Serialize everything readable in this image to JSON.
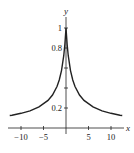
{
  "chart_data": {
    "type": "line",
    "title": "",
    "xlabel": "x",
    "ylabel": "y",
    "xlim": [
      -12.5,
      12.5
    ],
    "ylim": [
      0,
      1.05
    ],
    "grid": false,
    "legend": null,
    "x_ticks": [
      -10,
      -5,
      5,
      10
    ],
    "x_tick_labels": [
      "−10",
      "−5",
      "5",
      "10"
    ],
    "y_ticks": [
      0.2,
      0.4,
      0.6,
      0.8,
      1
    ],
    "y_tick_labels": [
      "0.2",
      "",
      "",
      "0.8",
      "1"
    ],
    "series": [
      {
        "name": "curve",
        "color": "#222222",
        "x": [
          -12.5,
          -12,
          -10,
          -8,
          -6,
          -4,
          -3,
          -2,
          -1.5,
          -1,
          -0.5,
          -0.25,
          0,
          0.25,
          0.5,
          1,
          1.5,
          2,
          3,
          4,
          6,
          8,
          10,
          12,
          12.5
        ],
        "y": [
          0.125,
          0.128,
          0.147,
          0.172,
          0.211,
          0.276,
          0.33,
          0.415,
          0.48,
          0.574,
          0.723,
          0.837,
          1.0,
          0.837,
          0.723,
          0.574,
          0.48,
          0.415,
          0.33,
          0.276,
          0.211,
          0.172,
          0.147,
          0.128,
          0.125
        ]
      }
    ]
  }
}
